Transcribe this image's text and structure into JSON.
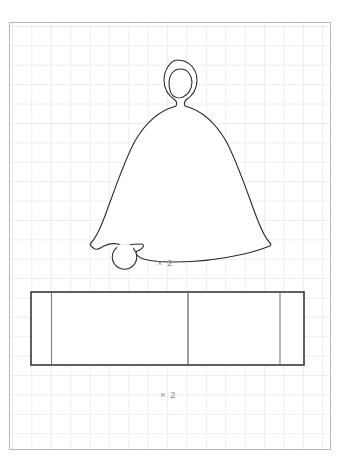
{
  "sheet": {
    "title": "Bell pattern template",
    "background_color": "#ffffff",
    "frame_color": "#b9b9bd",
    "grid_color": "#e9eaee",
    "grid_spacing_px": 19.4
  },
  "pieces": [
    {
      "id": "bell-piece",
      "name": "bell-body-shape",
      "description": "Bell silhouette with hanging loop at top and round clapper at lower left",
      "multiplier_label": "× 2",
      "stroke_color": "#2b2b2b",
      "fill_color": "#ffffff",
      "features": [
        "hanging-loop",
        "loop-hole",
        "flared-skirt",
        "clapper-circle"
      ]
    },
    {
      "id": "strip-piece",
      "name": "rectangular-strip-shape",
      "description": "Long rectangle band with three vertical fold lines",
      "multiplier_label": "× 2",
      "stroke_color": "#2b2b2b",
      "fill_color": "#ffffff",
      "fold_line_color": "#7d7d82",
      "fold_line_count": 3
    }
  ],
  "labels": {
    "bell_multiplier": "× 2",
    "strip_multiplier": "× 2"
  }
}
